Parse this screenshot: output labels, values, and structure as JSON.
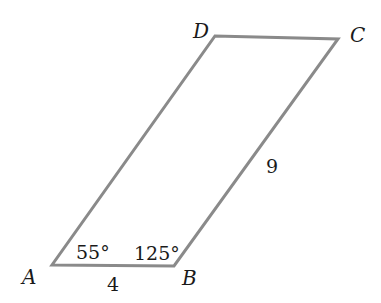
{
  "diagram": {
    "type": "parallelogram",
    "line_color": "#8a8a8a",
    "text_color": "#1a1a1a",
    "vertices": {
      "A": {
        "label": "A",
        "x": 52,
        "y": 265
      },
      "B": {
        "label": "B",
        "x": 174,
        "y": 266
      },
      "C": {
        "label": "C",
        "x": 338,
        "y": 39
      },
      "D": {
        "label": "D",
        "x": 215,
        "y": 36
      }
    },
    "side_labels": {
      "AB": "4",
      "BC": "9"
    },
    "angle_labels": {
      "A": "55°",
      "B": "125°"
    }
  }
}
